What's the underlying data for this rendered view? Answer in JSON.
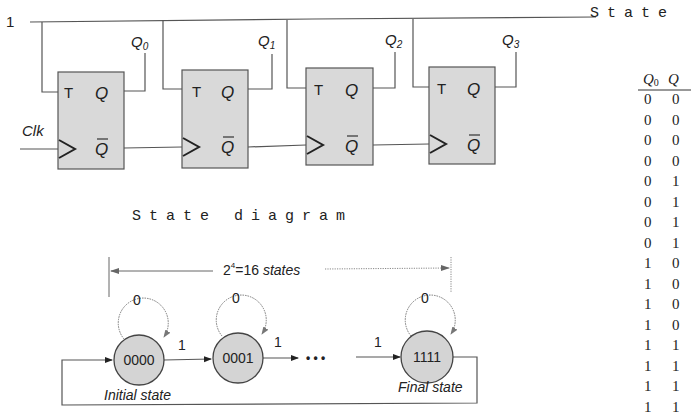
{
  "circuit": {
    "input_label": "1",
    "clock_label": "Clk",
    "flipflops": [
      {
        "id": "ff0",
        "t_label": "T",
        "q_label": "Q",
        "qbar_label": "Q",
        "output_name": "Q",
        "output_sub": "0"
      },
      {
        "id": "ff1",
        "t_label": "T",
        "q_label": "Q",
        "qbar_label": "Q",
        "output_name": "Q",
        "output_sub": "1"
      },
      {
        "id": "ff2",
        "t_label": "T",
        "q_label": "Q",
        "qbar_label": "Q",
        "output_name": "Q",
        "output_sub": "2"
      },
      {
        "id": "ff3",
        "t_label": "T",
        "q_label": "Q",
        "qbar_label": "Q",
        "output_name": "Q",
        "output_sub": "3"
      }
    ]
  },
  "state_diagram": {
    "title": "State diagram",
    "span_label_base": "2",
    "span_label_exp": "4",
    "span_label_rest": "=16 ",
    "span_label_italic": "states",
    "states": [
      {
        "name": "0000",
        "self_loop_label": "0",
        "caption": "Initial state"
      },
      {
        "name": "0001",
        "self_loop_label": "0",
        "caption": ""
      },
      {
        "name": "1111",
        "self_loop_label": "0",
        "caption": "Final state"
      }
    ],
    "transitions": [
      {
        "from": "0000",
        "to": "0001",
        "label": "1"
      },
      {
        "from": "0001",
        "to": "...",
        "label": "1"
      },
      {
        "from": "...",
        "to": "1111",
        "label": "1"
      }
    ],
    "ellipsis": "• • •"
  },
  "state_table": {
    "title": "State",
    "headers": [
      {
        "name": "Q",
        "sub": "0"
      },
      {
        "name": "Q",
        "sub": ""
      }
    ],
    "rows": [
      [
        "0",
        "0"
      ],
      [
        "0",
        "0"
      ],
      [
        "0",
        "0"
      ],
      [
        "0",
        "0"
      ],
      [
        "0",
        "1"
      ],
      [
        "0",
        "1"
      ],
      [
        "0",
        "1"
      ],
      [
        "0",
        "1"
      ],
      [
        "1",
        "0"
      ],
      [
        "1",
        "0"
      ],
      [
        "1",
        "0"
      ],
      [
        "1",
        "0"
      ],
      [
        "1",
        "1"
      ],
      [
        "1",
        "1"
      ],
      [
        "1",
        "1"
      ],
      [
        "1",
        "1"
      ]
    ]
  }
}
